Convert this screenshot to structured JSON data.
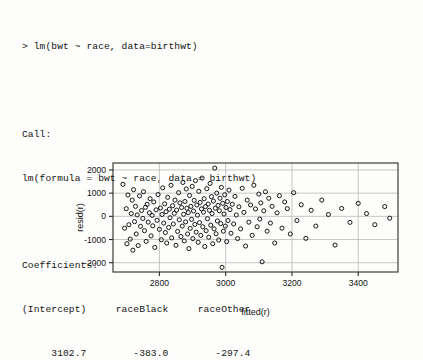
{
  "console": {
    "lines": [
      "> lm(bwt ~ race, data=birthwt)",
      "",
      "Call:",
      "lm(formula = bwt ~ race, data = birthwt)",
      "",
      "Coefficients:",
      "(Intercept)     raceBlack     raceOther",
      "     3102.7        -383.0        -297.4"
    ],
    "prompt_line": "> lm(bwt ~ race, data=birthwt)",
    "call_header": "Call:",
    "call_text": "lm(formula = bwt ~ race, data = birthwt)",
    "coefficients_header": "Coefficients:",
    "coefficient_names": [
      "(Intercept)",
      "raceBlack",
      "raceOther"
    ],
    "coefficient_values": [
      "3102.7",
      "-383.0",
      "-297.4"
    ]
  },
  "chart_data": {
    "type": "scatter",
    "title": "",
    "xlabel": "fitted(r)",
    "ylabel": "resid(r)",
    "xlim": [
      2660,
      3520
    ],
    "ylim": [
      -2400,
      2300
    ],
    "xticks": [
      2800,
      3000,
      3200,
      3400
    ],
    "yticks": [
      -2000,
      -1000,
      0,
      1000,
      2000
    ],
    "xtick_labels": [
      "2800",
      "3000",
      "3200",
      "3400"
    ],
    "ytick_labels": [
      "-2000",
      "-1000",
      "0",
      "1000",
      "2000"
    ],
    "grid": true,
    "legend": "none",
    "marker": "open-circle",
    "marker_color": "#0d0d0d",
    "grid_color": "#b7b7b7",
    "frame_color": "#2a2a2a",
    "note": "Residuals vs fitted values for lm(bwt ~ race). Fitted values take only three distinct levels (White 3102.7, Black 2719.7, Other 2805.3), jittered horizontally for display.",
    "points": [
      [
        2690,
        1380
      ],
      [
        2695,
        -510
      ],
      [
        2700,
        330
      ],
      [
        2702,
        -1180
      ],
      [
        2705,
        920
      ],
      [
        2708,
        -360
      ],
      [
        2712,
        -980
      ],
      [
        2715,
        120
      ],
      [
        2718,
        700
      ],
      [
        2720,
        -1460
      ],
      [
        2722,
        1150
      ],
      [
        2725,
        -230
      ],
      [
        2728,
        430
      ],
      [
        2730,
        -760
      ],
      [
        2733,
        60
      ],
      [
        2736,
        -1260
      ],
      [
        2740,
        880
      ],
      [
        2743,
        -430
      ],
      [
        2746,
        250
      ],
      [
        2750,
        -90
      ],
      [
        2752,
        1060
      ],
      [
        2755,
        -620
      ],
      [
        2758,
        390
      ],
      [
        2760,
        -1080
      ],
      [
        2763,
        520
      ],
      [
        2766,
        -250
      ],
      [
        2770,
        150
      ],
      [
        2772,
        760
      ],
      [
        2775,
        -840
      ],
      [
        2778,
        40
      ],
      [
        2780,
        -410
      ],
      [
        2783,
        620
      ],
      [
        2786,
        -1340
      ],
      [
        2790,
        280
      ],
      [
        2793,
        -170
      ],
      [
        2796,
        940
      ],
      [
        2800,
        -560
      ],
      [
        2803,
        360
      ],
      [
        2806,
        -1010
      ],
      [
        2808,
        80
      ],
      [
        2810,
        1230
      ],
      [
        2813,
        -290
      ],
      [
        2816,
        540
      ],
      [
        2818,
        -700
      ],
      [
        2820,
        200
      ],
      [
        2822,
        -1150
      ],
      [
        2825,
        820
      ],
      [
        2828,
        -480
      ],
      [
        2830,
        310
      ],
      [
        2832,
        -60
      ],
      [
        2835,
        1340
      ],
      [
        2837,
        -930
      ],
      [
        2840,
        460
      ],
      [
        2842,
        -330
      ],
      [
        2845,
        130
      ],
      [
        2847,
        700
      ],
      [
        2850,
        -1250
      ],
      [
        2852,
        270
      ],
      [
        2855,
        -650
      ],
      [
        2858,
        1020
      ],
      [
        2860,
        -150
      ],
      [
        2862,
        580
      ],
      [
        2865,
        -870
      ],
      [
        2867,
        380
      ],
      [
        2869,
        -420
      ],
      [
        2871,
        1460
      ],
      [
        2873,
        90
      ],
      [
        2875,
        -1060
      ],
      [
        2877,
        640
      ],
      [
        2879,
        -240
      ],
      [
        2881,
        1180
      ],
      [
        2883,
        350
      ],
      [
        2885,
        -760
      ],
      [
        2887,
        160
      ],
      [
        2889,
        -1390
      ],
      [
        2891,
        900
      ],
      [
        2893,
        -520
      ],
      [
        2895,
        430
      ],
      [
        2897,
        -130
      ],
      [
        2899,
        1290
      ],
      [
        2901,
        -960
      ],
      [
        2903,
        230
      ],
      [
        2905,
        690
      ],
      [
        2907,
        -350
      ],
      [
        2909,
        1540
      ],
      [
        2911,
        -680
      ],
      [
        2913,
        490
      ],
      [
        2915,
        50
      ],
      [
        2917,
        -1120
      ],
      [
        2919,
        1080
      ],
      [
        2921,
        -270
      ],
      [
        2923,
        600
      ],
      [
        2925,
        -820
      ],
      [
        2927,
        320
      ],
      [
        2929,
        1650
      ],
      [
        2931,
        -450
      ],
      [
        2933,
        180
      ],
      [
        2935,
        760
      ],
      [
        2937,
        -1300
      ],
      [
        2939,
        420
      ],
      [
        2941,
        -620
      ],
      [
        2943,
        1190
      ],
      [
        2945,
        -100
      ],
      [
        2947,
        530
      ],
      [
        2949,
        -900
      ],
      [
        2951,
        260
      ],
      [
        2953,
        1420
      ],
      [
        2955,
        -380
      ],
      [
        2957,
        850
      ],
      [
        2959,
        120
      ],
      [
        2961,
        -1180
      ],
      [
        2963,
        660
      ],
      [
        2965,
        -540
      ],
      [
        2967,
        2080
      ],
      [
        2969,
        350
      ],
      [
        2971,
        -750
      ],
      [
        2973,
        1000
      ],
      [
        2975,
        -200
      ],
      [
        2977,
        470
      ],
      [
        2979,
        -1020
      ],
      [
        2981,
        240
      ],
      [
        2983,
        780
      ],
      [
        2985,
        -310
      ],
      [
        2987,
        1250
      ],
      [
        2989,
        -2200
      ],
      [
        2991,
        560
      ],
      [
        2993,
        -640
      ],
      [
        2995,
        100
      ],
      [
        2997,
        930
      ],
      [
        2999,
        -420
      ],
      [
        3001,
        380
      ],
      [
        3003,
        -1090
      ],
      [
        3005,
        640
      ],
      [
        3007,
        -180
      ],
      [
        3010,
        1130
      ],
      [
        3013,
        290
      ],
      [
        3016,
        -730
      ],
      [
        3020,
        520
      ],
      [
        3024,
        -330
      ],
      [
        3028,
        860
      ],
      [
        3032,
        60
      ],
      [
        3036,
        -960
      ],
      [
        3040,
        410
      ],
      [
        3045,
        -540
      ],
      [
        3050,
        1210
      ],
      [
        3055,
        170
      ],
      [
        3060,
        -1280
      ],
      [
        3065,
        700
      ],
      [
        3070,
        -250
      ],
      [
        3075,
        490
      ],
      [
        3080,
        -820
      ],
      [
        3085,
        1340
      ],
      [
        3090,
        320
      ],
      [
        3095,
        -450
      ],
      [
        3100,
        960
      ],
      [
        3103,
        -120
      ],
      [
        3106,
        580
      ],
      [
        3110,
        -1960
      ],
      [
        3115,
        240
      ],
      [
        3120,
        1060
      ],
      [
        3125,
        -640
      ],
      [
        3130,
        780
      ],
      [
        3135,
        -290
      ],
      [
        3140,
        430
      ],
      [
        3148,
        -1150
      ],
      [
        3155,
        150
      ],
      [
        3162,
        890
      ],
      [
        3170,
        -510
      ],
      [
        3178,
        620
      ],
      [
        3186,
        330
      ],
      [
        3195,
        -760
      ],
      [
        3205,
        1020
      ],
      [
        3215,
        -180
      ],
      [
        3228,
        500
      ],
      [
        3242,
        -950
      ],
      [
        3258,
        260
      ],
      [
        3272,
        -420
      ],
      [
        3290,
        700
      ],
      [
        3310,
        80
      ],
      [
        3330,
        -1240
      ],
      [
        3350,
        340
      ],
      [
        3375,
        -260
      ],
      [
        3400,
        560
      ],
      [
        3425,
        120
      ],
      [
        3450,
        -360
      ],
      [
        3480,
        420
      ],
      [
        3495,
        -80
      ]
    ]
  }
}
